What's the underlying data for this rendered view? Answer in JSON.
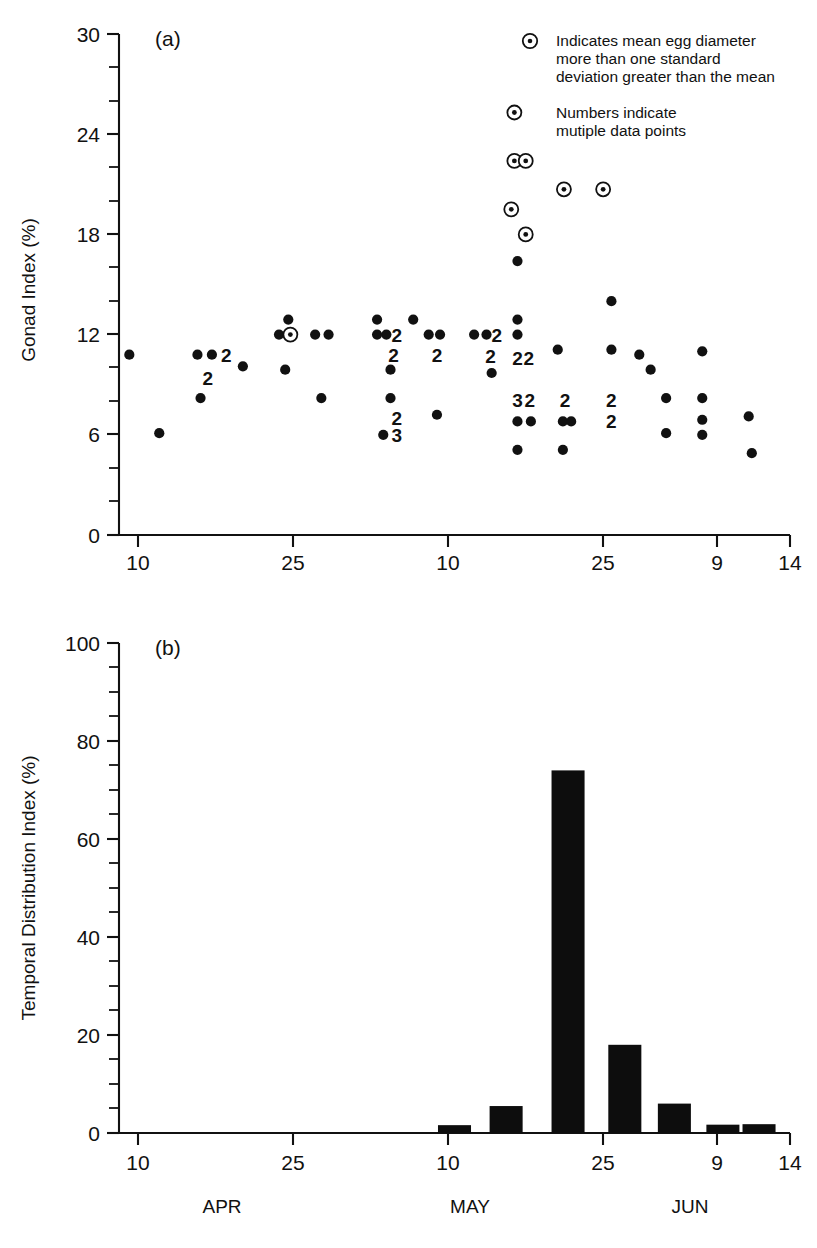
{
  "figure": {
    "background": "#ffffff",
    "ink_color": "#111111"
  },
  "panel_a": {
    "letter": "(a)",
    "legend": {
      "marker_symbol": "circled-dot",
      "entry1_line1": "Indicates mean egg diameter",
      "entry1_line2": "more than one standard",
      "entry1_line3": "deviation greater than the mean",
      "entry2_line1": "Numbers indicate",
      "entry2_line2": "mutiple data points"
    }
  },
  "panel_b": {
    "letter": "(b)"
  },
  "months": [
    {
      "label": "APR",
      "x_frac": 0.155
    },
    {
      "label": "MAY",
      "x_frac": 0.525
    },
    {
      "label": "JUN",
      "x_frac": 0.855
    }
  ],
  "chart_data": [
    {
      "type": "scatter",
      "panel": "(a)",
      "title": "",
      "xlabel": "",
      "ylabel": "Gonad Index (%)",
      "ylim": [
        0,
        30
      ],
      "yticks": [
        0,
        6,
        12,
        18,
        24,
        30
      ],
      "yticklabels": [
        "0",
        "6",
        "12",
        "18",
        "24",
        "30"
      ],
      "y_minor_step": 2,
      "xlim": [
        0,
        65
      ],
      "xticks": [
        1,
        16,
        31,
        46,
        57,
        62
      ],
      "xticklabels": [
        "10",
        "25",
        "10",
        "25",
        "9",
        "14"
      ],
      "grid": false,
      "legend_position": "top-right",
      "marker_types": {
        "filled": "mean egg diameter within one standard deviation of the mean",
        "circled": "mean egg diameter more than one standard deviation greater than the mean"
      },
      "points": [
        {
          "x": 1.0,
          "y": 10.8,
          "marker": "filled"
        },
        {
          "x": 3.9,
          "y": 6.1,
          "marker": "filled"
        },
        {
          "x": 7.6,
          "y": 10.8,
          "marker": "filled"
        },
        {
          "x": 9.0,
          "y": 10.8,
          "marker": "filled",
          "count": 2,
          "label": "2"
        },
        {
          "x": 8.6,
          "y": 9.4,
          "marker": "count-only",
          "count": 2,
          "label": "2"
        },
        {
          "x": 7.9,
          "y": 8.2,
          "marker": "filled"
        },
        {
          "x": 12.0,
          "y": 10.1,
          "marker": "filled"
        },
        {
          "x": 15.5,
          "y": 12.0,
          "marker": "filled"
        },
        {
          "x": 16.6,
          "y": 12.0,
          "marker": "circled"
        },
        {
          "x": 16.4,
          "y": 12.9,
          "marker": "filled"
        },
        {
          "x": 16.1,
          "y": 9.9,
          "marker": "filled"
        },
        {
          "x": 19.0,
          "y": 12.0,
          "marker": "filled"
        },
        {
          "x": 20.3,
          "y": 12.0,
          "marker": "filled"
        },
        {
          "x": 19.6,
          "y": 8.2,
          "marker": "filled"
        },
        {
          "x": 25.0,
          "y": 12.9,
          "marker": "filled"
        },
        {
          "x": 25.0,
          "y": 12.0,
          "marker": "filled"
        },
        {
          "x": 25.9,
          "y": 12.0,
          "marker": "filled"
        },
        {
          "x": 26.9,
          "y": 12.0,
          "marker": "count-only",
          "count": 2,
          "label": "2"
        },
        {
          "x": 26.6,
          "y": 10.8,
          "marker": "count-only",
          "count": 2,
          "label": "2"
        },
        {
          "x": 26.3,
          "y": 9.9,
          "marker": "filled"
        },
        {
          "x": 26.3,
          "y": 8.2,
          "marker": "filled"
        },
        {
          "x": 26.9,
          "y": 7.0,
          "marker": "count-only",
          "count": 2,
          "label": "2"
        },
        {
          "x": 26.9,
          "y": 6.0,
          "marker": "count-only",
          "count": 3,
          "label": "3"
        },
        {
          "x": 25.6,
          "y": 6.0,
          "marker": "filled"
        },
        {
          "x": 28.5,
          "y": 12.9,
          "marker": "filled"
        },
        {
          "x": 30.0,
          "y": 12.0,
          "marker": "filled"
        },
        {
          "x": 31.1,
          "y": 12.0,
          "marker": "filled"
        },
        {
          "x": 30.8,
          "y": 10.8,
          "marker": "count-only",
          "count": 2,
          "label": "2"
        },
        {
          "x": 30.8,
          "y": 7.2,
          "marker": "filled"
        },
        {
          "x": 34.4,
          "y": 12.0,
          "marker": "filled"
        },
        {
          "x": 35.6,
          "y": 12.0,
          "marker": "filled"
        },
        {
          "x": 36.6,
          "y": 12.0,
          "marker": "count-only",
          "count": 2,
          "label": "2"
        },
        {
          "x": 36.0,
          "y": 10.7,
          "marker": "count-only",
          "count": 2,
          "label": "2"
        },
        {
          "x": 36.1,
          "y": 9.7,
          "marker": "filled"
        },
        {
          "x": 38.6,
          "y": 16.4,
          "marker": "filled"
        },
        {
          "x": 38.0,
          "y": 19.5,
          "marker": "circled"
        },
        {
          "x": 39.4,
          "y": 18.0,
          "marker": "circled"
        },
        {
          "x": 38.3,
          "y": 22.4,
          "marker": "circled"
        },
        {
          "x": 39.4,
          "y": 22.4,
          "marker": "circled"
        },
        {
          "x": 38.3,
          "y": 25.3,
          "marker": "circled"
        },
        {
          "x": 43.1,
          "y": 20.7,
          "marker": "circled"
        },
        {
          "x": 38.6,
          "y": 12.9,
          "marker": "filled"
        },
        {
          "x": 38.6,
          "y": 12.0,
          "marker": "filled"
        },
        {
          "x": 38.6,
          "y": 10.6,
          "marker": "count-only",
          "count": 2,
          "label": "2"
        },
        {
          "x": 39.7,
          "y": 10.6,
          "marker": "count-only",
          "count": 2,
          "label": "2"
        },
        {
          "x": 38.6,
          "y": 8.1,
          "marker": "count-only",
          "count": 3,
          "label": "3"
        },
        {
          "x": 39.8,
          "y": 8.1,
          "marker": "count-only",
          "count": 2,
          "label": "2"
        },
        {
          "x": 38.6,
          "y": 6.8,
          "marker": "filled"
        },
        {
          "x": 39.9,
          "y": 6.8,
          "marker": "filled"
        },
        {
          "x": 38.6,
          "y": 5.1,
          "marker": "filled"
        },
        {
          "x": 42.5,
          "y": 11.1,
          "marker": "filled"
        },
        {
          "x": 43.2,
          "y": 8.1,
          "marker": "count-only",
          "count": 2,
          "label": "2"
        },
        {
          "x": 43.0,
          "y": 6.8,
          "marker": "filled"
        },
        {
          "x": 43.8,
          "y": 6.8,
          "marker": "filled"
        },
        {
          "x": 43.0,
          "y": 5.1,
          "marker": "filled"
        },
        {
          "x": 47.7,
          "y": 14.0,
          "marker": "filled"
        },
        {
          "x": 46.9,
          "y": 20.7,
          "marker": "circled"
        },
        {
          "x": 47.7,
          "y": 11.1,
          "marker": "filled"
        },
        {
          "x": 47.7,
          "y": 8.1,
          "marker": "count-only",
          "count": 2,
          "label": "2"
        },
        {
          "x": 47.7,
          "y": 6.8,
          "marker": "count-only",
          "count": 2,
          "label": "2"
        },
        {
          "x": 50.4,
          "y": 10.8,
          "marker": "filled"
        },
        {
          "x": 51.5,
          "y": 9.9,
          "marker": "filled"
        },
        {
          "x": 53.0,
          "y": 8.2,
          "marker": "filled"
        },
        {
          "x": 53.0,
          "y": 6.1,
          "marker": "filled"
        },
        {
          "x": 56.5,
          "y": 11.0,
          "marker": "filled"
        },
        {
          "x": 56.5,
          "y": 8.2,
          "marker": "filled"
        },
        {
          "x": 56.5,
          "y": 6.9,
          "marker": "filled"
        },
        {
          "x": 56.5,
          "y": 6.0,
          "marker": "filled"
        },
        {
          "x": 61.0,
          "y": 7.1,
          "marker": "filled"
        },
        {
          "x": 61.3,
          "y": 4.9,
          "marker": "filled"
        }
      ]
    },
    {
      "type": "bar",
      "panel": "(b)",
      "title": "",
      "xlabel": "",
      "ylabel": "Temporal Distribution Index (%)",
      "ylim": [
        0,
        100
      ],
      "yticks": [
        0,
        20,
        40,
        60,
        80,
        100
      ],
      "yticklabels": [
        "0",
        "20",
        "40",
        "60",
        "80",
        "100"
      ],
      "y_minor_step": 5,
      "xlim": [
        0,
        65
      ],
      "xticks": [
        1,
        16,
        31,
        46,
        57,
        62
      ],
      "xticklabels": [
        "10",
        "25",
        "10",
        "25",
        "9",
        "14"
      ],
      "grid": false,
      "categories": [
        "31",
        "36",
        "42",
        "48",
        "53",
        "58",
        "62"
      ],
      "values": [
        1.6,
        5.5,
        74.0,
        18.0,
        6.0,
        1.7,
        1.8
      ],
      "bar_x_centers": [
        32.5,
        37.5,
        43.5,
        49.0,
        53.8,
        58.5,
        62.0
      ],
      "bar_width": 3.2
    }
  ]
}
